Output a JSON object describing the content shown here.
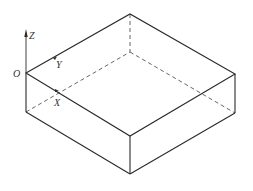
{
  "diagram": {
    "type": "isometric-box",
    "labels": {
      "origin": "O",
      "x_axis": "X",
      "y_axis": "Y",
      "z_axis": "Z"
    },
    "colors": {
      "line": "#2a2a2a",
      "hidden_line": "#555555",
      "background": "#ffffff"
    },
    "vertices": {
      "O": [
        26,
        73
      ],
      "top_back": [
        130,
        14
      ],
      "right": [
        235,
        74
      ],
      "front_top": [
        130,
        136
      ],
      "front_bottom": [
        130,
        174
      ],
      "right_bottom": [
        235,
        113
      ],
      "left_bottom": [
        26,
        112
      ],
      "hidden_back_bottom": [
        130,
        52
      ]
    }
  }
}
